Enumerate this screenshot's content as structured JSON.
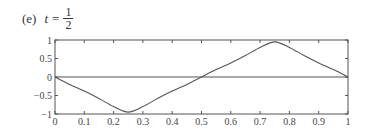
{
  "caption": {
    "label": "(e)",
    "variable": "t",
    "equals": "=",
    "numerator": "1",
    "denominator": "2"
  },
  "chart_data": {
    "type": "line",
    "xlabel": "",
    "ylabel": "",
    "xlim": [
      0,
      1
    ],
    "ylim": [
      -1,
      1
    ],
    "grid": false,
    "legend": null,
    "x_ticks": [
      "0",
      "0.1",
      "0.2",
      "0.3",
      "0.4",
      "0.5",
      "0.6",
      "0.7",
      "0.8",
      "0.9",
      "1"
    ],
    "y_ticks": [
      "1",
      "0.5",
      "0",
      "−0.5",
      "−1"
    ],
    "series": [
      {
        "name": "curve",
        "x": [
          0,
          0.05,
          0.1,
          0.15,
          0.2,
          0.25,
          0.3,
          0.35,
          0.4,
          0.45,
          0.5,
          0.55,
          0.6,
          0.65,
          0.7,
          0.75,
          0.8,
          0.85,
          0.9,
          0.95,
          1
        ],
        "y": [
          0,
          -0.2,
          -0.38,
          -0.58,
          -0.8,
          -0.95,
          -0.8,
          -0.58,
          -0.38,
          -0.2,
          0,
          0.2,
          0.38,
          0.58,
          0.8,
          0.95,
          0.8,
          0.58,
          0.38,
          0.2,
          0
        ]
      },
      {
        "name": "zero-line",
        "x": [
          0,
          1
        ],
        "y": [
          0,
          0
        ]
      }
    ]
  }
}
